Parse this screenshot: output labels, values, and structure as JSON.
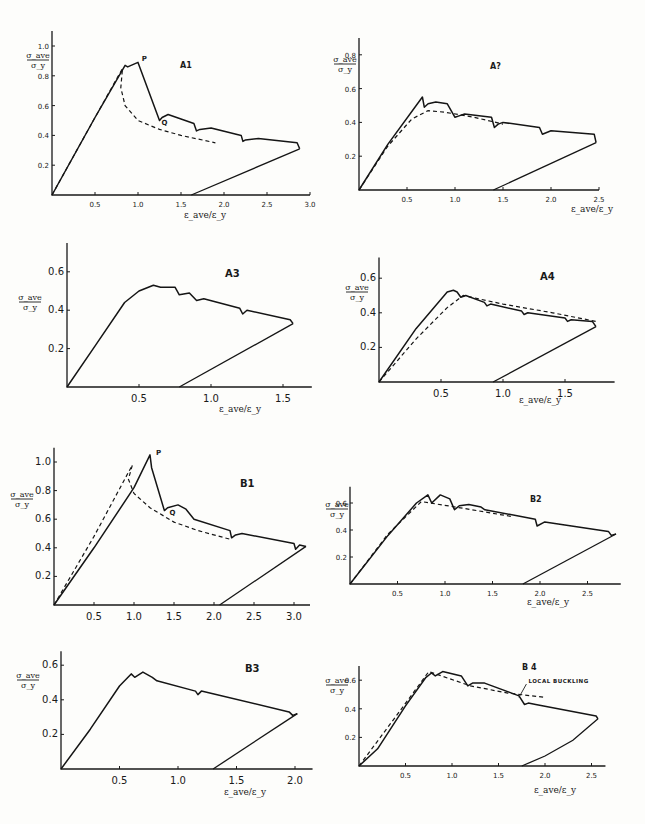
{
  "figure": {
    "xlabel": "ε_ave / ε_y",
    "ylabel": "σ_ave / σ_y"
  },
  "chart_data": [
    {
      "id": "A1",
      "type": "line",
      "title": "A1",
      "xlabel": "ε_ave/ε_y",
      "ylabel": "σ_ave/σ_y",
      "xlim": [
        0,
        3.0
      ],
      "ylim": [
        0,
        1.1
      ],
      "xticks": [
        0.5,
        1.0,
        1.5,
        2.0,
        2.5,
        3.0
      ],
      "xtick_labels": [
        "0.5",
        "1.0",
        "1.5",
        "2.0",
        "2.5",
        "3.0"
      ],
      "yticks": [
        0.2,
        0.4,
        0.6,
        0.8,
        1.0
      ],
      "ytick_labels": [
        "0.2",
        "0.4",
        "0.6",
        "0.8",
        "1.0"
      ],
      "annotations": [
        {
          "text": "P",
          "x": 1.02,
          "y": 0.9
        },
        {
          "text": "Q",
          "x": 1.25,
          "y": 0.47
        }
      ],
      "series": [
        {
          "name": "experiment",
          "style": "solid",
          "x": [
            0,
            0.5,
            0.85,
            0.88,
            0.92,
            1.0,
            1.25,
            1.28,
            1.35,
            1.65,
            1.68,
            1.72,
            1.85,
            2.2,
            2.22,
            2.25,
            2.4,
            2.85,
            2.88
          ],
          "y": [
            0,
            0.52,
            0.87,
            0.86,
            0.87,
            0.89,
            0.5,
            0.52,
            0.54,
            0.48,
            0.43,
            0.44,
            0.45,
            0.4,
            0.36,
            0.37,
            0.38,
            0.35,
            0.31
          ]
        },
        {
          "name": "unloading",
          "style": "solid",
          "x": [
            1.62,
            2.88
          ],
          "y": [
            0,
            0.31
          ]
        },
        {
          "name": "theory",
          "style": "dashed",
          "x": [
            0,
            0.5,
            0.82,
            0.8,
            0.85,
            1.0,
            1.25,
            1.5,
            1.9
          ],
          "y": [
            0,
            0.52,
            0.85,
            0.72,
            0.6,
            0.5,
            0.44,
            0.4,
            0.35
          ]
        }
      ]
    },
    {
      "id": "A2",
      "type": "line",
      "title": "A?",
      "xlabel": "ε_ave/ε_y",
      "ylabel": "σ_ave/σ_y",
      "xlim": [
        0,
        2.5
      ],
      "ylim": [
        0,
        0.9
      ],
      "xticks": [
        0.5,
        1.0,
        1.5,
        2.0,
        2.5
      ],
      "xtick_labels": [
        "0.5",
        "1.0",
        "1.5",
        "2.0",
        "2.5"
      ],
      "yticks": [
        0.2,
        0.4,
        0.6,
        0.8
      ],
      "ytick_labels": [
        "0.2",
        "0.4",
        "0.6",
        "0.8"
      ],
      "annotations": [],
      "series": [
        {
          "name": "experiment",
          "style": "solid",
          "x": [
            0,
            0.3,
            0.66,
            0.68,
            0.72,
            0.8,
            0.92,
            1.0,
            1.05,
            1.1,
            1.38,
            1.41,
            1.45,
            1.5,
            1.88,
            1.91,
            2.0,
            2.45,
            2.47
          ],
          "y": [
            0,
            0.27,
            0.55,
            0.49,
            0.51,
            0.52,
            0.51,
            0.43,
            0.44,
            0.45,
            0.43,
            0.37,
            0.39,
            0.4,
            0.37,
            0.33,
            0.35,
            0.33,
            0.28
          ]
        },
        {
          "name": "unloading",
          "style": "solid",
          "x": [
            1.4,
            2.47
          ],
          "y": [
            0,
            0.28
          ]
        },
        {
          "name": "theory",
          "style": "dashed",
          "x": [
            0,
            0.3,
            0.55,
            0.72,
            0.9,
            1.2,
            1.5
          ],
          "y": [
            0,
            0.26,
            0.42,
            0.47,
            0.46,
            0.43,
            0.39
          ]
        }
      ]
    },
    {
      "id": "A3",
      "type": "line",
      "title": "A3",
      "xlabel": "ε_ave/ε_y",
      "ylabel": "σ_ave/σ_y",
      "xlim": [
        0,
        1.7
      ],
      "ylim": [
        0,
        0.75
      ],
      "xticks": [
        0.5,
        1.0,
        1.5
      ],
      "xtick_labels": [
        "0.5",
        "1.0",
        "1.5"
      ],
      "yticks": [
        0.2,
        0.4,
        0.6
      ],
      "ytick_labels": [
        "0.2",
        "0.4",
        "0.6"
      ],
      "annotations": [],
      "series": [
        {
          "name": "experiment",
          "style": "solid",
          "x": [
            0,
            0.2,
            0.4,
            0.5,
            0.6,
            0.65,
            0.75,
            0.78,
            0.85,
            0.9,
            0.95,
            1.2,
            1.22,
            1.25,
            1.55,
            1.57
          ],
          "y": [
            0,
            0.22,
            0.44,
            0.5,
            0.53,
            0.52,
            0.52,
            0.48,
            0.49,
            0.45,
            0.46,
            0.41,
            0.38,
            0.4,
            0.35,
            0.33
          ]
        },
        {
          "name": "unloading",
          "style": "solid",
          "x": [
            0.78,
            1.57
          ],
          "y": [
            0,
            0.33
          ]
        }
      ]
    },
    {
      "id": "A4",
      "type": "line",
      "title": "A4",
      "xlabel": "ε_ave/ε_y",
      "ylabel": "σ_ave/σ_y",
      "xlim": [
        0,
        1.9
      ],
      "ylim": [
        0,
        0.72
      ],
      "xticks": [
        0.5,
        1.0,
        1.5
      ],
      "xtick_labels": [
        "0.5",
        "1.0",
        "1.5"
      ],
      "yticks": [
        0.2,
        0.4,
        0.6
      ],
      "ytick_labels": [
        "0.2",
        "0.4",
        "0.6"
      ],
      "annotations": [],
      "series": [
        {
          "name": "experiment",
          "style": "solid",
          "x": [
            0,
            0.3,
            0.55,
            0.6,
            0.63,
            0.66,
            0.7,
            0.85,
            0.87,
            0.9,
            1.15,
            1.17,
            1.2,
            1.5,
            1.52,
            1.55,
            1.72,
            1.75
          ],
          "y": [
            0,
            0.31,
            0.52,
            0.53,
            0.52,
            0.49,
            0.5,
            0.46,
            0.44,
            0.45,
            0.41,
            0.39,
            0.4,
            0.37,
            0.35,
            0.36,
            0.35,
            0.32
          ]
        },
        {
          "name": "unloading",
          "style": "solid",
          "x": [
            0.92,
            1.75
          ],
          "y": [
            0,
            0.32
          ]
        },
        {
          "name": "theory",
          "style": "dashed",
          "x": [
            0,
            0.3,
            0.55,
            0.68,
            1.0,
            1.4,
            1.75
          ],
          "y": [
            0,
            0.25,
            0.43,
            0.5,
            0.45,
            0.4,
            0.35
          ]
        }
      ]
    },
    {
      "id": "B1",
      "type": "line",
      "title": "B1",
      "xlabel": "ε_ave/ε_y",
      "ylabel": "σ_ave/σ_y",
      "xlim": [
        0,
        3.2
      ],
      "ylim": [
        0,
        1.1
      ],
      "xticks": [
        0.5,
        1.0,
        1.5,
        2.0,
        2.5,
        3.0
      ],
      "xtick_labels": [
        "0.5",
        "1.0",
        "1.5",
        "2.0",
        "2.5",
        "3.0"
      ],
      "yticks": [
        0.2,
        0.4,
        0.6,
        0.8,
        1.0
      ],
      "ytick_labels": [
        "0.2",
        "0.4",
        "0.6",
        "0.8",
        "1.0"
      ],
      "annotations": [
        {
          "text": "P",
          "x": 1.25,
          "y": 1.05
        },
        {
          "text": "Q",
          "x": 1.42,
          "y": 0.63
        }
      ],
      "series": [
        {
          "name": "experiment",
          "style": "solid",
          "x": [
            0,
            0.5,
            1.0,
            1.2,
            1.22,
            1.38,
            1.42,
            1.55,
            1.65,
            1.75,
            2.2,
            2.22,
            2.27,
            2.35,
            3.0,
            3.02,
            3.07,
            3.15
          ],
          "y": [
            0,
            0.4,
            0.82,
            1.05,
            0.96,
            0.66,
            0.68,
            0.7,
            0.67,
            0.6,
            0.52,
            0.47,
            0.49,
            0.5,
            0.43,
            0.39,
            0.42,
            0.41
          ]
        },
        {
          "name": "unloading",
          "style": "solid",
          "x": [
            2.07,
            3.15
          ],
          "y": [
            0,
            0.41
          ]
        },
        {
          "name": "theory",
          "style": "dashed",
          "x": [
            0,
            0.5,
            0.98,
            0.93,
            1.0,
            1.2,
            1.5,
            1.8,
            2.2
          ],
          "y": [
            0,
            0.48,
            0.98,
            0.88,
            0.78,
            0.68,
            0.58,
            0.52,
            0.46
          ]
        }
      ]
    },
    {
      "id": "B2",
      "type": "line",
      "title": "B2",
      "xlabel": "ε_ave/ε_y",
      "ylabel": "σ_ave/σ_y",
      "xlim": [
        0,
        2.85
      ],
      "ylim": [
        0,
        0.72
      ],
      "xticks": [
        0.5,
        1.0,
        1.5,
        2.0,
        2.5
      ],
      "xtick_labels": [
        "0.5",
        "1.0",
        "1.5",
        "2.0",
        "2.5"
      ],
      "yticks": [
        0.2,
        0.4,
        0.6
      ],
      "ytick_labels": [
        "0.2",
        "0.4",
        "0.6"
      ],
      "annotations": [],
      "series": [
        {
          "name": "experiment",
          "style": "solid",
          "x": [
            0,
            0.4,
            0.7,
            0.82,
            0.86,
            0.95,
            1.05,
            1.1,
            1.15,
            1.25,
            1.38,
            1.42,
            1.8,
            1.95,
            1.97,
            2.05,
            2.72,
            2.75,
            2.8
          ],
          "y": [
            0,
            0.36,
            0.6,
            0.66,
            0.6,
            0.66,
            0.63,
            0.55,
            0.58,
            0.59,
            0.57,
            0.55,
            0.5,
            0.48,
            0.43,
            0.46,
            0.39,
            0.36,
            0.37
          ]
        },
        {
          "name": "unloading",
          "style": "solid",
          "x": [
            1.82,
            2.8
          ],
          "y": [
            0,
            0.37
          ]
        },
        {
          "name": "theory",
          "style": "dashed",
          "x": [
            0,
            0.4,
            0.75,
            1.2,
            1.7
          ],
          "y": [
            0,
            0.37,
            0.61,
            0.56,
            0.5
          ]
        }
      ]
    },
    {
      "id": "B3",
      "type": "line",
      "title": "B3",
      "xlabel": "ε_ave/ε_y",
      "ylabel": "σ_ave/σ_y",
      "xlim": [
        0,
        2.15
      ],
      "ylim": [
        0,
        0.68
      ],
      "xticks": [
        0.5,
        1.0,
        1.5,
        2.0
      ],
      "xtick_labels": [
        "0.5",
        "1.0",
        "1.5",
        "2.0"
      ],
      "yticks": [
        0.2,
        0.4,
        0.6
      ],
      "ytick_labels": [
        "0.2",
        "0.4",
        "0.6"
      ],
      "annotations": [],
      "series": [
        {
          "name": "experiment",
          "style": "solid",
          "x": [
            0,
            0.25,
            0.5,
            0.6,
            0.63,
            0.7,
            0.78,
            0.82,
            1.15,
            1.17,
            1.2,
            1.95,
            1.98,
            2.02
          ],
          "y": [
            0,
            0.23,
            0.48,
            0.55,
            0.53,
            0.56,
            0.53,
            0.51,
            0.45,
            0.43,
            0.45,
            0.33,
            0.31,
            0.32
          ]
        },
        {
          "name": "unloading",
          "style": "solid",
          "x": [
            1.3,
            2.02
          ],
          "y": [
            0,
            0.32
          ]
        }
      ]
    },
    {
      "id": "B4",
      "type": "line",
      "title": "B 4",
      "xlabel": "ε_ave/ε_y",
      "ylabel": "σ_ave/σ_y",
      "xlim": [
        0,
        2.65
      ],
      "ylim": [
        0,
        0.7
      ],
      "xticks": [
        0.5,
        1.0,
        1.5,
        2.0,
        2.5
      ],
      "xtick_labels": [
        "0.5",
        "1.0",
        "1.5",
        "2.0",
        "2.5"
      ],
      "yticks": [
        0.2,
        0.4,
        0.6
      ],
      "ytick_labels": [
        "0.2",
        "0.4",
        "0.6"
      ],
      "annotations": [
        {
          "text": "LOCAL BUCKLING",
          "x": 1.8,
          "y": 0.58,
          "arrow_to": [
            1.72,
            0.48
          ]
        }
      ],
      "series": [
        {
          "name": "experiment",
          "style": "solid",
          "x": [
            0,
            0.2,
            0.5,
            0.72,
            0.78,
            0.82,
            0.9,
            1.1,
            1.17,
            1.22,
            1.35,
            1.72,
            1.78,
            1.82,
            1.9,
            2.55,
            2.57
          ],
          "y": [
            0,
            0.12,
            0.42,
            0.62,
            0.65,
            0.63,
            0.66,
            0.63,
            0.56,
            0.58,
            0.58,
            0.49,
            0.43,
            0.44,
            0.43,
            0.35,
            0.33
          ]
        },
        {
          "name": "unloading",
          "style": "solid",
          "x": [
            1.75,
            2.0,
            2.3,
            2.57
          ],
          "y": [
            0,
            0.07,
            0.18,
            0.33
          ]
        },
        {
          "name": "theory",
          "style": "dashed",
          "x": [
            0,
            0.4,
            0.75,
            1.2,
            1.6,
            2.0
          ],
          "y": [
            0,
            0.35,
            0.66,
            0.56,
            0.51,
            0.48
          ]
        }
      ]
    }
  ],
  "layout": [
    {
      "id": "A1",
      "ox": 52,
      "oy": 195,
      "sx": 86,
      "sy": 149,
      "big": false,
      "title_pos": [
        180,
        68
      ],
      "xlabel_pos": [
        205,
        218
      ],
      "ylabel_pos": [
        38,
        58
      ]
    },
    {
      "id": "A2",
      "ox": 359,
      "oy": 190,
      "sx": 96,
      "sy": 169,
      "big": false,
      "title_pos": [
        490,
        69
      ],
      "xlabel_pos": [
        592,
        212
      ],
      "ylabel_pos": [
        345,
        62
      ]
    },
    {
      "id": "A3",
      "ox": 67,
      "oy": 387,
      "sx": 144,
      "sy": 192,
      "big": true,
      "title_pos": [
        225,
        277
      ],
      "xlabel_pos": [
        240,
        412
      ],
      "ylabel_pos": [
        30,
        300
      ]
    },
    {
      "id": "A4",
      "ox": 379,
      "oy": 382,
      "sx": 124,
      "sy": 173,
      "big": true,
      "title_pos": [
        540,
        280
      ],
      "xlabel_pos": [
        540,
        403
      ],
      "ylabel_pos": [
        357,
        290
      ]
    },
    {
      "id": "B1",
      "ox": 54,
      "oy": 605,
      "sx": 80,
      "sy": 143,
      "big": true,
      "title_pos": [
        240,
        487
      ],
      "xlabel_pos": null,
      "ylabel_pos": [
        22,
        497
      ]
    },
    {
      "id": "B2",
      "ox": 350,
      "oy": 584,
      "sx": 95,
      "sy": 135,
      "big": false,
      "title_pos": [
        530,
        502
      ],
      "xlabel_pos": [
        548,
        605
      ],
      "ylabel_pos": [
        337,
        507
      ]
    },
    {
      "id": "B3",
      "ox": 61,
      "oy": 769,
      "sx": 117,
      "sy": 173,
      "big": true,
      "title_pos": [
        245,
        672
      ],
      "xlabel_pos": [
        245,
        795
      ],
      "ylabel_pos": [
        28,
        678
      ]
    },
    {
      "id": "B4",
      "ox": 359,
      "oy": 766,
      "sx": 93,
      "sy": 143,
      "big": false,
      "title_pos": [
        522,
        670
      ],
      "xlabel_pos": [
        555,
        793
      ],
      "ylabel_pos": [
        337,
        683
      ]
    }
  ]
}
